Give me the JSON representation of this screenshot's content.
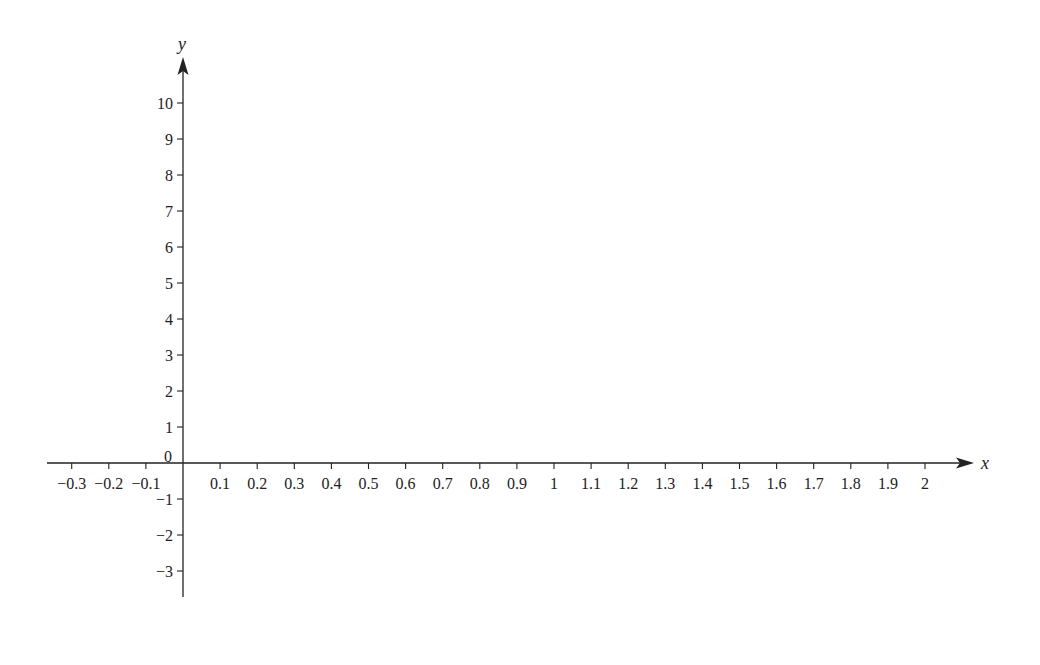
{
  "chart_data": {
    "type": "line",
    "title": "",
    "xlabel": "x",
    "ylabel": "y",
    "xlim": [
      -0.35,
      2.2
    ],
    "ylim": [
      -3.7,
      11.3
    ],
    "grid": false,
    "legend": null,
    "series": [],
    "x_ticks": [
      -0.3,
      -0.2,
      -0.1,
      0.1,
      0.2,
      0.3,
      0.4,
      0.5,
      0.6,
      0.7,
      0.8,
      0.9,
      1,
      1.1,
      1.2,
      1.3,
      1.4,
      1.5,
      1.6,
      1.7,
      1.8,
      1.9,
      2
    ],
    "x_tick_labels": [
      "−0.3",
      "−0.2",
      "−0.1",
      "0.1",
      "0.2",
      "0.3",
      "0.4",
      "0.5",
      "0.6",
      "0.7",
      "0.8",
      "0.9",
      "1",
      "1.1",
      "1.2",
      "1.3",
      "1.4",
      "1.5",
      "1.6",
      "1.7",
      "1.8",
      "1.9",
      "2"
    ],
    "y_ticks": [
      10,
      9,
      8,
      7,
      6,
      5,
      4,
      3,
      2,
      1,
      -1,
      -2,
      -3
    ],
    "y_tick_labels": [
      "10",
      "9",
      "8",
      "7",
      "6",
      "5",
      "4",
      "3",
      "2",
      "1",
      "−1",
      "−2",
      "−3"
    ],
    "origin_label": "0"
  },
  "style": {
    "axis_color": "#222222",
    "background": "#ffffff"
  }
}
